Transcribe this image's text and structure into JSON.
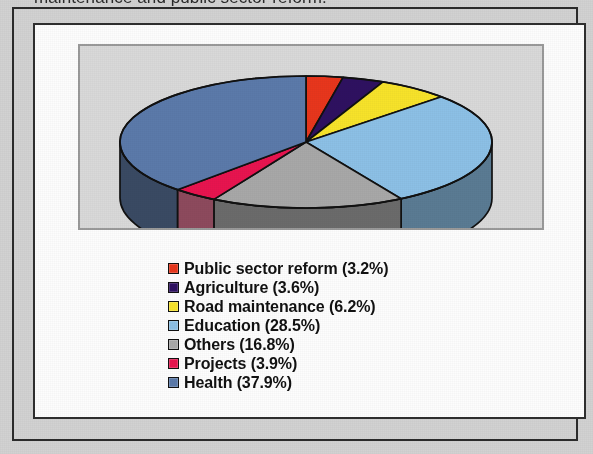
{
  "page": {
    "caption_truncated": "maintenance and public sector reform.",
    "background_color": "#d2d2d2",
    "frame_border_color": "#2b2b2b",
    "panel_background": "#fdfdfd",
    "plot_background": "#d9d9d9"
  },
  "chart_data": {
    "type": "pie",
    "title": "",
    "subtitle": "",
    "xlabel": "",
    "ylabel": "",
    "style": "3d-exploded-disc",
    "legend_position": "bottom-center",
    "grid": false,
    "units": "percent",
    "total": 100.1,
    "categories": [
      "Public sector reform",
      "Agriculture",
      "Road maintenance",
      "Education",
      "Others",
      "Projects",
      "Health"
    ],
    "values": [
      3.2,
      3.6,
      6.2,
      28.5,
      16.8,
      3.9,
      37.9
    ],
    "colors": [
      "#e8361c",
      "#2e1160",
      "#f7e32a",
      "#8cc0e6",
      "#a8a8a8",
      "#e8144f",
      "#5b7aaa"
    ],
    "side_colors": [
      "#8f2011",
      "#1b0a3a",
      "#9a8e18",
      "#5a7b93",
      "#6b6b6b",
      "#8d4a5d",
      "#3a4a63"
    ],
    "slices": [
      {
        "label": "Public sector reform",
        "value": 3.2,
        "display": "Public sector reform (3.2%)",
        "color": "#e8361c"
      },
      {
        "label": "Agriculture",
        "value": 3.6,
        "display": "Agriculture (3.6%)",
        "color": "#2e1160"
      },
      {
        "label": "Road maintenance",
        "value": 6.2,
        "display": "Road maintenance (6.2%)",
        "color": "#f7e32a"
      },
      {
        "label": "Education",
        "value": 28.5,
        "display": "Education (28.5%)",
        "color": "#8cc0e6"
      },
      {
        "label": "Others",
        "value": 16.8,
        "display": "Others (16.8%)",
        "color": "#a8a8a8"
      },
      {
        "label": "Projects",
        "value": 3.9,
        "display": "Projects (3.9%)",
        "color": "#e8144f"
      },
      {
        "label": "Health",
        "value": 37.9,
        "display": "Health (37.9%)",
        "color": "#5b7aaa"
      }
    ]
  },
  "legend": {
    "items": [
      {
        "text": "Public sector reform (3.2%)",
        "color": "#e8361c"
      },
      {
        "text": "Agriculture (3.6%)",
        "color": "#2e1160"
      },
      {
        "text": "Road maintenance (6.2%)",
        "color": "#f7e32a"
      },
      {
        "text": "Education (28.5%)",
        "color": "#8cc0e6"
      },
      {
        "text": "Others (16.8%)",
        "color": "#a8a8a8"
      },
      {
        "text": "Projects (3.9%)",
        "color": "#e8144f"
      },
      {
        "text": "Health (37.9%)",
        "color": "#5b7aaa"
      }
    ]
  }
}
